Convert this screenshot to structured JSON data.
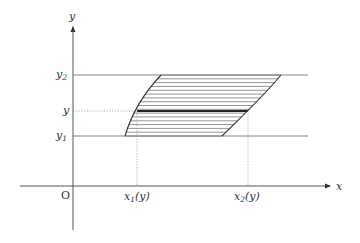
{
  "diagram": {
    "axes": {
      "x_label": "x",
      "y_label": "y",
      "origin_label": "O"
    },
    "y_levels": {
      "y2": {
        "label": "y",
        "subscript": "2"
      },
      "y": {
        "label": "y",
        "subscript": ""
      },
      "y1": {
        "label": "y",
        "subscript": "1"
      }
    },
    "x_markers": {
      "x1": {
        "label": "x",
        "subscript": "1",
        "arg": "(y)"
      },
      "x2": {
        "label": "x",
        "subscript": "2",
        "arg": "(y)"
      }
    },
    "colors": {
      "axis": "#444444",
      "line": "#555555",
      "hatch": "#777777",
      "highlight": "#222222",
      "dotted": "#999999"
    },
    "hatch_lines": 16
  }
}
